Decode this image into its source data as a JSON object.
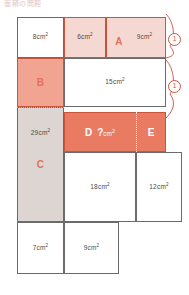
{
  "header": {
    "caption": "面積の問題"
  },
  "diagram": {
    "type": "area-partition-puzzle",
    "unit": "cm2",
    "regions": [
      {
        "id": "r1",
        "label": "8cm",
        "sup": "2",
        "x": 17,
        "y": 17,
        "w": 47,
        "h": 41,
        "fill": "f-white",
        "border": "b-thin",
        "style": "lbl"
      },
      {
        "id": "r2",
        "label": "6cm",
        "sup": "2",
        "x": 64,
        "y": 17,
        "w": 42,
        "h": 41,
        "fill": "f-pinklt",
        "border": "b-red",
        "style": "lbl"
      },
      {
        "id": "rA",
        "label": "A",
        "sup": "",
        "x": 106,
        "y": 17,
        "w": 60,
        "h": 41,
        "fill": "f-pinklt",
        "border": "b-red",
        "style": "lbl-red"
      },
      {
        "id": "r3",
        "label": "9cm",
        "sup": "2",
        "x": 106,
        "y": 17,
        "w": 60,
        "h": 41,
        "fill": "f-pinklt",
        "border": "b-none",
        "style": "lbl"
      },
      {
        "id": "rB",
        "label": "B",
        "sup": "",
        "x": 17,
        "y": 58,
        "w": 47,
        "h": 49,
        "fill": "f-pinkmd",
        "border": "b-red",
        "style": "lbl-red"
      },
      {
        "id": "r4",
        "label": "15cm",
        "sup": "2",
        "x": 64,
        "y": 58,
        "w": 102,
        "h": 49,
        "fill": "f-white",
        "border": "b-thin",
        "style": "lbl"
      },
      {
        "id": "rC",
        "label": "C",
        "sup": "",
        "x": 17,
        "y": 107,
        "w": 47,
        "h": 115,
        "fill": "f-gray",
        "border": "b-thin",
        "style": "lbl-red"
      },
      {
        "id": "r5",
        "label": "29cm",
        "sup": "2",
        "x": 17,
        "y": 107,
        "w": 47,
        "h": 115,
        "fill": "f-gray",
        "border": "b-none",
        "style": "lbl"
      },
      {
        "id": "rD",
        "label": "D",
        "sup": "",
        "x": 64,
        "y": 112,
        "w": 72,
        "h": 40,
        "fill": "f-salmon",
        "border": "b-red",
        "style": "lbl-on-dark"
      },
      {
        "id": "rE",
        "label": "E",
        "sup": "",
        "x": 136,
        "y": 112,
        "w": 30,
        "h": 40,
        "fill": "f-salmon",
        "border": "b-red",
        "style": "lbl-on-dark"
      },
      {
        "id": "r6",
        "label": "18cm",
        "sup": "2",
        "x": 64,
        "y": 152,
        "w": 72,
        "h": 70,
        "fill": "f-white",
        "border": "b-thin",
        "style": "lbl"
      },
      {
        "id": "r7",
        "label": "12cm",
        "sup": "2",
        "x": 136,
        "y": 152,
        "w": 46,
        "h": 70,
        "fill": "f-white",
        "border": "b-thin",
        "style": "lbl"
      },
      {
        "id": "r8",
        "label": "7cm",
        "sup": "2",
        "x": 17,
        "y": 222,
        "w": 47,
        "h": 52,
        "fill": "f-white",
        "border": "b-thin",
        "style": "lbl"
      },
      {
        "id": "r9",
        "label": "9cm",
        "sup": "2",
        "x": 64,
        "y": 222,
        "w": 55,
        "h": 52,
        "fill": "f-white",
        "border": "b-thin",
        "style": "lbl"
      }
    ],
    "unknown": {
      "label": "?",
      "unit": "cm",
      "sup": "2"
    },
    "markers": [
      {
        "id": "m1",
        "value": "1",
        "x": 168,
        "y": 33
      },
      {
        "id": "m2",
        "value": "1",
        "x": 168,
        "y": 80
      }
    ],
    "colors": {
      "accent_red": "#e4705a",
      "stroke_red": "#c9553c",
      "stroke_gray": "#6b6b6b",
      "fill_light_pink": "#f6d8d2",
      "fill_mid_pink": "#f2a492",
      "fill_salmon": "#ea7b63",
      "fill_gray": "#dcd5d2"
    }
  }
}
